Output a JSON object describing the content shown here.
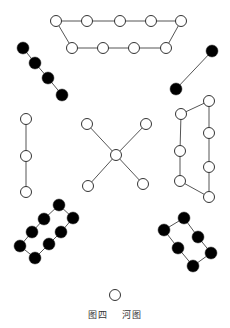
{
  "title": "河图",
  "caption": {
    "figure_label": "图四",
    "name": "河图"
  },
  "colors": {
    "line": "#555555",
    "yin_fill": "#000000",
    "yang_fill": "#ffffff",
    "stroke": "#333333"
  },
  "dot_radius": 6,
  "groups": [
    {
      "id": "top-seven-white",
      "position": "top",
      "color": "white",
      "count": 9,
      "dots": [
        [
          56,
          21
        ],
        [
          87,
          21
        ],
        [
          120,
          21
        ],
        [
          151,
          21
        ],
        [
          181,
          21
        ],
        [
          166,
          48
        ],
        [
          134,
          48
        ],
        [
          103,
          48
        ],
        [
          72,
          48
        ]
      ],
      "path": [
        [
          56,
          21
        ],
        [
          87,
          21
        ],
        [
          120,
          21
        ],
        [
          151,
          21
        ],
        [
          181,
          21
        ],
        [
          166,
          48
        ],
        [
          134,
          48
        ],
        [
          103,
          48
        ],
        [
          72,
          48
        ],
        [
          56,
          21
        ]
      ]
    },
    {
      "id": "top-left-black",
      "position": "upper-left",
      "color": "black",
      "count": 4,
      "dots": [
        [
          23,
          48
        ],
        [
          35,
          63
        ],
        [
          48,
          78
        ],
        [
          62,
          95
        ]
      ],
      "path": [
        [
          23,
          48
        ],
        [
          35,
          63
        ],
        [
          48,
          78
        ],
        [
          62,
          95
        ]
      ]
    },
    {
      "id": "top-right-black",
      "position": "upper-right",
      "color": "black",
      "count": 2,
      "dots": [
        [
          212,
          51
        ],
        [
          176,
          89
        ]
      ],
      "path": [
        [
          212,
          51
        ],
        [
          176,
          89
        ]
      ]
    },
    {
      "id": "left-white",
      "position": "left",
      "color": "white",
      "count": 3,
      "dots": [
        [
          26,
          119
        ],
        [
          26,
          156
        ],
        [
          26,
          192
        ]
      ],
      "path": [
        [
          26,
          119
        ],
        [
          26,
          156
        ],
        [
          26,
          192
        ]
      ]
    },
    {
      "id": "center-white",
      "position": "center",
      "color": "white",
      "count": 5,
      "dots": [
        [
          116,
          155
        ],
        [
          87,
          124
        ],
        [
          146,
          124
        ],
        [
          88,
          186
        ],
        [
          143,
          184
        ]
      ],
      "spokes": [
        [
          [
            116,
            155
          ],
          [
            87,
            124
          ]
        ],
        [
          [
            116,
            155
          ],
          [
            146,
            124
          ]
        ],
        [
          [
            116,
            155
          ],
          [
            88,
            186
          ]
        ],
        [
          [
            116,
            155
          ],
          [
            143,
            184
          ]
        ]
      ]
    },
    {
      "id": "right-white",
      "position": "right",
      "color": "white",
      "count": 7,
      "dots": [
        [
          209,
          101
        ],
        [
          181,
          114
        ],
        [
          180,
          151
        ],
        [
          180,
          181
        ],
        [
          209,
          197
        ],
        [
          209,
          167
        ],
        [
          209,
          133
        ]
      ],
      "path": [
        [
          209,
          101
        ],
        [
          181,
          114
        ],
        [
          180,
          151
        ],
        [
          180,
          181
        ],
        [
          209,
          197
        ],
        [
          209,
          167
        ],
        [
          209,
          133
        ],
        [
          209,
          101
        ]
      ]
    },
    {
      "id": "bottom-left-black",
      "position": "lower-left",
      "color": "black",
      "count": 8,
      "dots": [
        [
          59,
          205
        ],
        [
          44,
          219
        ],
        [
          32,
          232
        ],
        [
          20,
          246
        ],
        [
          35,
          258
        ],
        [
          49,
          244
        ],
        [
          61,
          232
        ],
        [
          73,
          218
        ]
      ],
      "path": [
        [
          59,
          205
        ],
        [
          44,
          219
        ],
        [
          32,
          232
        ],
        [
          20,
          246
        ],
        [
          35,
          258
        ],
        [
          49,
          244
        ],
        [
          61,
          232
        ],
        [
          73,
          218
        ],
        [
          59,
          205
        ]
      ]
    },
    {
      "id": "bottom-right-black",
      "position": "lower-right",
      "color": "black",
      "count": 6,
      "dots": [
        [
          184,
          218
        ],
        [
          164,
          230
        ],
        [
          178,
          248
        ],
        [
          193,
          266
        ],
        [
          211,
          253
        ],
        [
          198,
          237
        ]
      ],
      "path": [
        [
          184,
          218
        ],
        [
          164,
          230
        ],
        [
          178,
          248
        ],
        [
          193,
          266
        ],
        [
          211,
          253
        ],
        [
          198,
          237
        ],
        [
          184,
          218
        ]
      ]
    },
    {
      "id": "bottom-single-white",
      "position": "bottom",
      "color": "white",
      "count": 1,
      "dots": [
        [
          115,
          295
        ]
      ],
      "path": []
    }
  ]
}
